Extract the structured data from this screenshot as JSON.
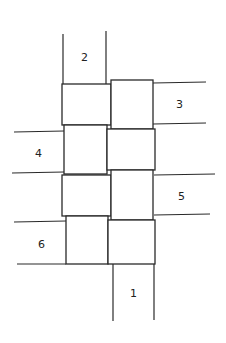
{
  "diagram": {
    "strips": [
      {
        "id": "1",
        "label": "1",
        "orientation": "vertical",
        "position": "bottom"
      },
      {
        "id": "2",
        "label": "2",
        "orientation": "vertical",
        "position": "top"
      },
      {
        "id": "3",
        "label": "3",
        "orientation": "horizontal",
        "position": "right-upper"
      },
      {
        "id": "4",
        "label": "4",
        "orientation": "horizontal",
        "position": "left-upper"
      },
      {
        "id": "5",
        "label": "5",
        "orientation": "horizontal",
        "position": "right-lower"
      },
      {
        "id": "6",
        "label": "6",
        "orientation": "horizontal",
        "position": "left-lower"
      }
    ],
    "labels": {
      "s1": "1",
      "s2": "2",
      "s3": "3",
      "s4": "4",
      "s5": "5",
      "s6": "6"
    },
    "grid": {
      "rows": 4,
      "cols": 2
    },
    "colors": {
      "stroke": "#2a2a2a",
      "background": "#ffffff"
    }
  }
}
